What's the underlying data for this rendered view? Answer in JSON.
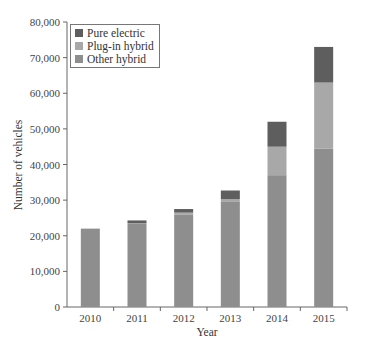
{
  "chart_data": {
    "type": "bar",
    "stacked": true,
    "title": "",
    "xlabel": "Year",
    "ylabel": "Number of vehicles",
    "ylim": [
      0,
      80000
    ],
    "yticks": [
      0,
      10000,
      20000,
      30000,
      40000,
      50000,
      60000,
      70000,
      80000
    ],
    "ytick_labels": [
      "0",
      "10,000",
      "20,000",
      "30,000",
      "40,000",
      "50,000",
      "60,000",
      "70,000",
      "80,000"
    ],
    "categories": [
      "2010",
      "2011",
      "2012",
      "2013",
      "2014",
      "2015"
    ],
    "grid": false,
    "legend_position": "upper left",
    "series": [
      {
        "name": "Other hybrid",
        "color": "#8e8e8e",
        "values": [
          22000,
          23300,
          26000,
          29500,
          37000,
          44500
        ]
      },
      {
        "name": "Plug-in hybrid",
        "color": "#a8a8a8",
        "values": [
          0,
          200,
          500,
          800,
          8000,
          18500
        ]
      },
      {
        "name": "Pure electric",
        "color": "#5e5e5e",
        "values": [
          0,
          800,
          1000,
          2400,
          7000,
          10000
        ]
      }
    ],
    "legend": [
      "Pure electric",
      "Plug-in hybrid",
      "Other hybrid"
    ]
  }
}
